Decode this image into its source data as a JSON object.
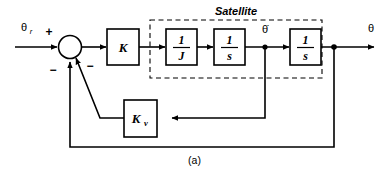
{
  "figure": {
    "caption": "(a)",
    "group_label": "Satellite"
  },
  "signals": {
    "input_label": "θ",
    "input_sub": "r",
    "rate_label": "θ̇",
    "output_label": "θ"
  },
  "summing_junction": {
    "sign_input": "+",
    "sign_outer_feedback": "−",
    "sign_rate_feedback": "−"
  },
  "blocks": [
    {
      "name": "gain-k",
      "label": "K",
      "kind": "gain"
    },
    {
      "name": "inertia",
      "numerator": "1",
      "denominator": "J",
      "kind": "fraction"
    },
    {
      "name": "integrator-1",
      "numerator": "1",
      "denominator": "s",
      "kind": "fraction"
    },
    {
      "name": "integrator-2",
      "numerator": "1",
      "denominator": "s",
      "kind": "fraction"
    },
    {
      "name": "rate-gain",
      "label": "K",
      "sublabel": "v",
      "kind": "gain-sub"
    }
  ],
  "colors": {
    "line": "#000000",
    "background": "#ffffff",
    "box_fill": "#ffffff"
  }
}
